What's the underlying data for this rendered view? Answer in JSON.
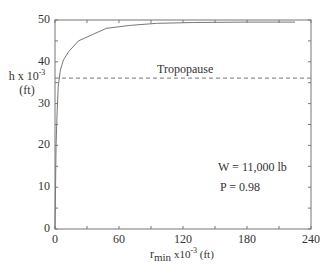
{
  "chart_data": {
    "type": "line",
    "title": "",
    "xlabel": "r min x10^-3 (ft)",
    "ylabel": "h x 10^-3 (ft)",
    "xlim": [
      0,
      240
    ],
    "ylim": [
      0,
      50
    ],
    "xticks": [
      0,
      60,
      120,
      180,
      240
    ],
    "yticks": [
      0,
      10,
      20,
      30,
      40,
      50
    ],
    "grid": false,
    "series": [
      {
        "name": "minimum turn radius",
        "x": [
          0,
          1,
          2,
          3,
          5,
          8,
          13,
          22,
          35,
          48,
          70,
          95,
          130,
          180,
          225
        ],
        "y": [
          0,
          20,
          28,
          34,
          38,
          40.5,
          42.5,
          45,
          46.5,
          48,
          48.7,
          49.2,
          49.4,
          49.5,
          49.5
        ]
      }
    ],
    "reference_lines": [
      {
        "label": "Tropopause",
        "y": 36.1,
        "style": "dashed"
      }
    ],
    "annotations": [
      "W = 11,000 lb",
      "P = 0.98"
    ]
  },
  "labels": {
    "x_ticks": [
      "0",
      "60",
      "120",
      "180",
      "240"
    ],
    "y_ticks": [
      "0",
      "10",
      "20",
      "30",
      "40",
      "50"
    ],
    "ylabel_line1": "h x 10",
    "ylabel_exp": "-3",
    "ylabel_line2": "(ft)",
    "xlabel_main": "r",
    "xlabel_sub": "min",
    "xlabel_rest": " x10",
    "xlabel_exp": "-3",
    "xlabel_unit": " (ft)",
    "tropopause": "Tropopause",
    "weight": "W = 11,000 lb",
    "power": "P = 0.98"
  }
}
